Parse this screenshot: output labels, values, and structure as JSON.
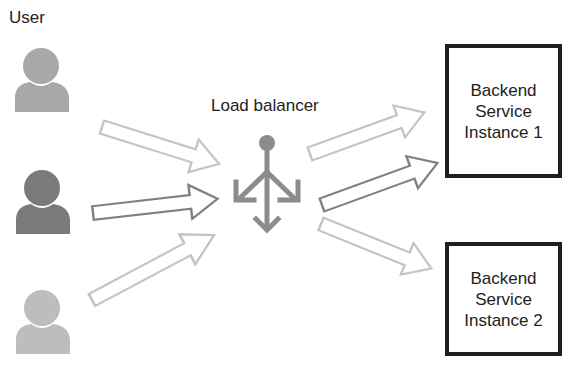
{
  "diagram": {
    "user_label": "User",
    "load_balancer_label": "Load balancer",
    "users": [
      {
        "id": "user-1",
        "color": "#a8a8a8"
      },
      {
        "id": "user-2",
        "color": "#7a7a7a"
      },
      {
        "id": "user-3",
        "color": "#bdbdbd"
      }
    ],
    "backends": [
      {
        "line1": "Backend",
        "line2": "Service",
        "line3": "Instance 1"
      },
      {
        "line1": "Backend",
        "line2": "Service",
        "line3": "Instance 2"
      }
    ],
    "arrows": [
      {
        "from": "user-1",
        "to": "load-balancer",
        "color": "#c4c4c4"
      },
      {
        "from": "user-2",
        "to": "load-balancer",
        "color": "#808080"
      },
      {
        "from": "user-3",
        "to": "load-balancer",
        "color": "#c4c4c4"
      },
      {
        "from": "load-balancer",
        "to": "backend-1",
        "color": "#c4c4c4"
      },
      {
        "from": "load-balancer",
        "to": "backend-1",
        "color": "#808080"
      },
      {
        "from": "load-balancer",
        "to": "backend-2",
        "color": "#c4c4c4"
      }
    ],
    "colors": {
      "light_arrow": "#c4c4c4",
      "dark_arrow": "#808080",
      "load_balancer_icon": "#8c8c8c",
      "box_border": "#1e1e1e"
    }
  }
}
